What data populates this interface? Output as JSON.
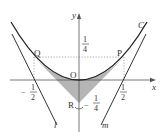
{
  "diagram": {
    "axes": {
      "x_label": "x",
      "y_label": "y"
    },
    "curve_label": "C",
    "points": {
      "origin": "O",
      "P": "P",
      "Q": "Q",
      "R": "R"
    },
    "lines": {
      "l": "l",
      "m": "m"
    },
    "fractions": {
      "y_quarter": {
        "num": "1",
        "den": "4"
      },
      "x_neg_half": {
        "sign": "−",
        "num": "1",
        "den": "2"
      },
      "x_half": {
        "num": "1",
        "den": "2"
      },
      "r_neg_quarter": {
        "sign": "−",
        "num": "1",
        "den": "4"
      }
    },
    "colors": {
      "shade": "#b5b5b5",
      "line": "#333333",
      "dotted": "#888888"
    }
  }
}
